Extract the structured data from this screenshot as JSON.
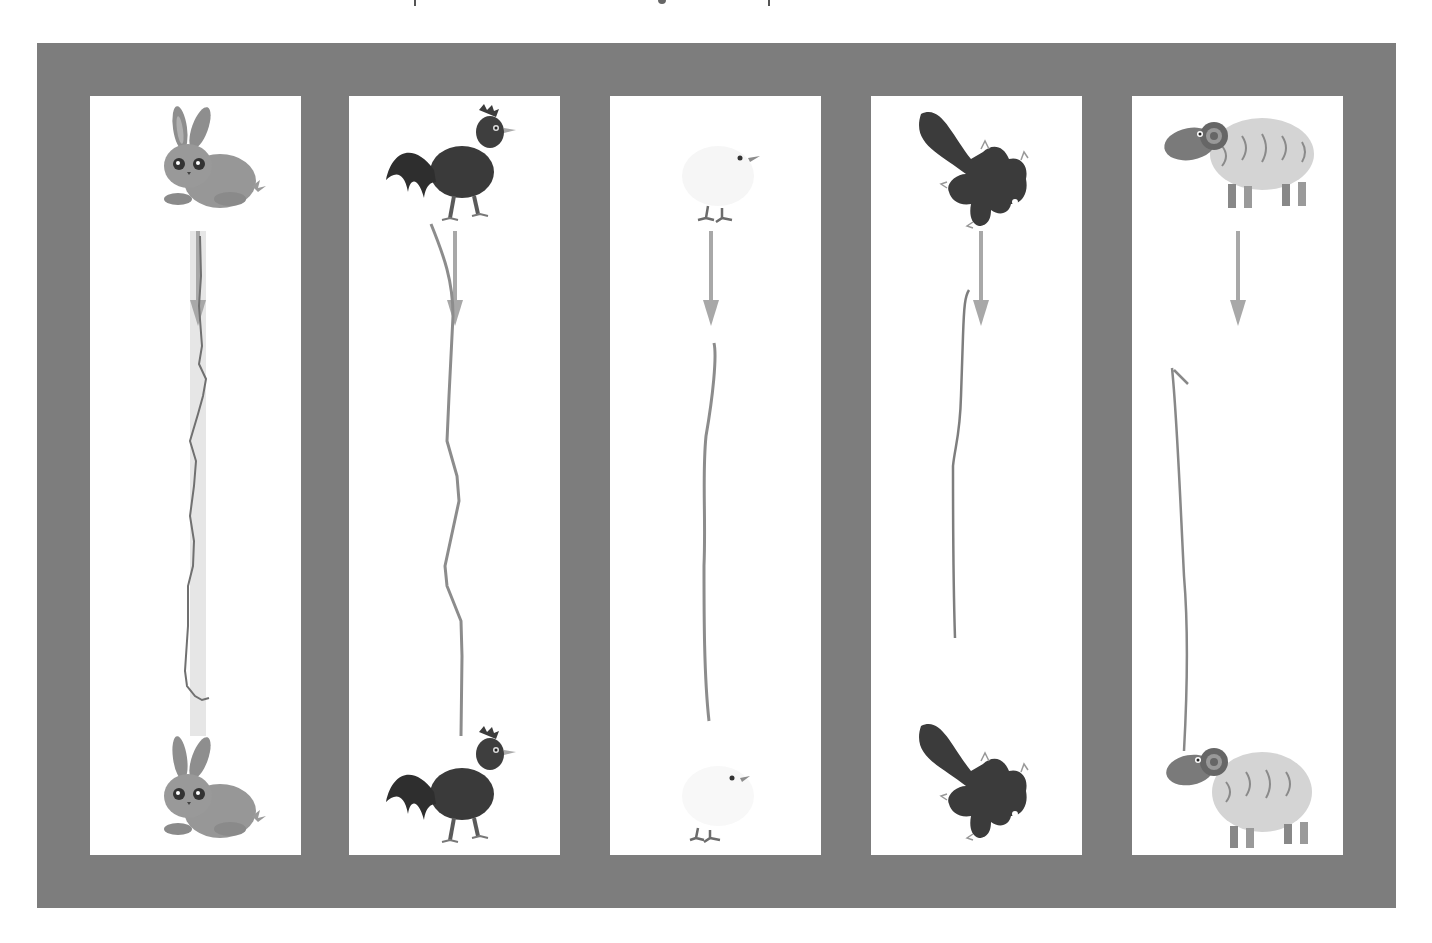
{
  "worksheet": {
    "type": "matching-trace-worksheet",
    "frame_color": "#7d7d7d",
    "panel_color": "#ffffff",
    "guide_arrow_color": "#a8a8a8",
    "trace_line_color": "#8a8a8a",
    "panels": [
      {
        "index": 1,
        "top_animal": "rabbit",
        "bottom_animal": "rabbit",
        "has_highlight_guide": true
      },
      {
        "index": 2,
        "top_animal": "rooster",
        "bottom_animal": "rooster",
        "has_highlight_guide": false
      },
      {
        "index": 3,
        "top_animal": "chick",
        "bottom_animal": "chick",
        "has_highlight_guide": false
      },
      {
        "index": 4,
        "top_animal": "squirrel-silhouette",
        "bottom_animal": "squirrel-silhouette",
        "has_highlight_guide": false
      },
      {
        "index": 5,
        "top_animal": "ram-sheep",
        "bottom_animal": "ram-sheep",
        "has_highlight_guide": false
      }
    ]
  }
}
